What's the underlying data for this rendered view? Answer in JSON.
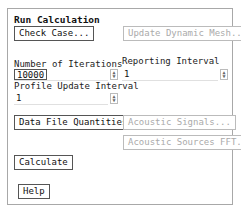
{
  "panel": {
    "title": "Run Calculation",
    "check_case": "Check Case...",
    "update_dynamic_mesh": "Update Dynamic Mesh...",
    "iterations_label": "Number of Iterations",
    "iterations_value": "10000",
    "reporting_label": "Reporting Interval",
    "reporting_value": "1",
    "profile_label": "Profile Update Interval",
    "profile_value": "1",
    "data_file_quantities": "Data File Quantities...",
    "acoustic_signals": "Acoustic Signals...",
    "acoustic_sources_fft": "Acoustic Sources FFT...",
    "calculate": "Calculate",
    "help": "Help"
  }
}
